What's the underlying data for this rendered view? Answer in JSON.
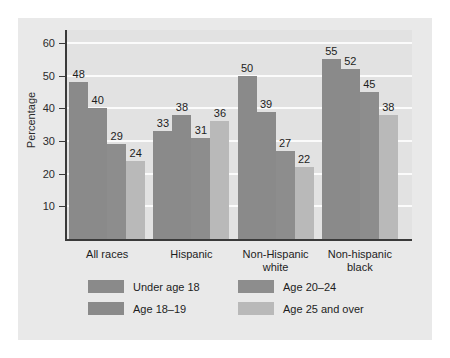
{
  "chart_data": {
    "type": "bar",
    "title": "",
    "xlabel": "",
    "ylabel": "Percentage",
    "ylim": [
      0,
      64
    ],
    "yticks": [
      10,
      20,
      30,
      40,
      50,
      60
    ],
    "grid": true,
    "legend_position": "bottom",
    "categories": [
      "All races",
      "Hispanic",
      "Non-Hispanic\nwhite",
      "Non-hispanic\nblack"
    ],
    "category_labels": [
      {
        "line1": "All races",
        "line2": ""
      },
      {
        "line1": "Hispanic",
        "line2": ""
      },
      {
        "line1": "Non-Hispanic",
        "line2": "white"
      },
      {
        "line1": "Non-hispanic",
        "line2": "black"
      }
    ],
    "series": [
      {
        "name": "Under age 18",
        "color": "#8a8a8a",
        "values": [
          48,
          33,
          50,
          55
        ]
      },
      {
        "name": "Age 18–19",
        "color": "#8a8a8a",
        "values": [
          40,
          38,
          39,
          52
        ]
      },
      {
        "name": "Age 20–24",
        "color": "#8d8d8d",
        "values": [
          29,
          31,
          27,
          45
        ]
      },
      {
        "name": "Age 25 and over",
        "color": "#b9b9b9",
        "values": [
          24,
          36,
          22,
          38
        ]
      }
    ]
  },
  "colors": {
    "figure_background": "#e9e9e9",
    "plot_background": "#e2e2e2",
    "gridline": "#fbfbfb",
    "axis": "#3a3a3a",
    "text": "#1d1d1d"
  }
}
